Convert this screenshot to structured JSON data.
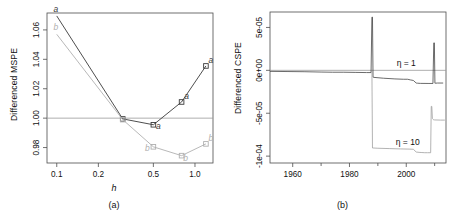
{
  "figure": {
    "corner_mark": "",
    "background": "#ffffff"
  },
  "panels": [
    {
      "id": "a",
      "caption": "(a)",
      "xlabel": "h",
      "ylabel": "Differenced MSPE"
    },
    {
      "id": "b",
      "caption": "(b)",
      "xlabel": "",
      "ylabel": "Differenced CSPE"
    }
  ],
  "colors": {
    "series_a": "#3a3a3a",
    "series_b": "#b0b0b0",
    "axis": "#4d4d4d",
    "reference_line": "#999999",
    "curve_eta1": "#3a3a3a",
    "curve_eta10": "#9a9a9a"
  },
  "chart_data": [
    {
      "type": "line",
      "panel": "a",
      "title": "",
      "xlabel": "h",
      "ylabel": "Differenced MSPE",
      "xscale": "log",
      "xlim": [
        0.085,
        1.35
      ],
      "ylim": [
        0.9695,
        1.0715
      ],
      "xticks": [
        0.1,
        0.2,
        0.5,
        1.0
      ],
      "xticklabels": [
        "0.1",
        "0.2",
        "0.5",
        "1.0"
      ],
      "yticks": [
        0.98,
        1.0,
        1.02,
        1.04,
        1.06
      ],
      "yticklabels": [
        "0.98",
        "1.00",
        "1.02",
        "1.04",
        "1.06"
      ],
      "grid": false,
      "reference_line_y": 1.0,
      "point_marker": "square",
      "series": [
        {
          "name": "a",
          "label": "a",
          "color": "#3a3a3a",
          "x": [
            0.1,
            0.3,
            0.5,
            0.8,
            1.2
          ],
          "values": [
            1.0695,
            0.9995,
            0.9955,
            1.011,
            1.0355
          ]
        },
        {
          "name": "b",
          "label": "b",
          "color": "#b0b0b0",
          "x": [
            0.1,
            0.3,
            0.5,
            0.8,
            1.2
          ],
          "values": [
            1.057,
            0.999,
            0.9805,
            0.9745,
            0.9825
          ]
        }
      ]
    },
    {
      "type": "line",
      "panel": "b",
      "title": "",
      "xlabel": "",
      "ylabel": "Differenced CSPE",
      "xlim": [
        1952,
        2014
      ],
      "ylim": [
        -0.000108,
        6.8e-05
      ],
      "xticks": [
        1960,
        1980,
        2000
      ],
      "xticklabels": [
        "1960",
        "1980",
        "2000"
      ],
      "yticks": [
        -0.0001,
        -5e-05,
        0.0,
        5e-05
      ],
      "yticklabels": [
        "-1e-04",
        "-5e-05",
        "0e+00",
        "5e-05"
      ],
      "grid": false,
      "reference_line_y": 0.0,
      "annotations": [
        {
          "text": "η = 1",
          "x": 2000,
          "y": 4.5e-06
        },
        {
          "text": "η = 10",
          "x": 2000.5,
          "y": -8.75e-05
        }
      ],
      "series": [
        {
          "name": "eta1",
          "label": "η = 1",
          "color": "#3a3a3a",
          "x": [
            1952,
            1958,
            1964,
            1970,
            1974,
            1978,
            1982,
            1986,
            1987.6,
            1987.9,
            1988.1,
            1988.3,
            1988.45,
            1988.6,
            1992,
            1996,
            1999,
            2000.5,
            2001.5,
            2002.5,
            2003.5,
            2004,
            2005,
            2008,
            2009.4,
            2009.7,
            2009.9,
            2010.1,
            2010.3,
            2011,
            2013
          ],
          "values": [
            -1.2e-06,
            -1.4e-06,
            -1.6e-06,
            -2e-06,
            -2.2e-06,
            -2.2e-06,
            -2.4e-06,
            -2.6e-06,
            -2.6e-06,
            6.2e-05,
            6.2e-05,
            -8e-06,
            -8.1e-06,
            -8.2e-06,
            -9.2e-06,
            -1e-05,
            -1.04e-05,
            -1.04e-05,
            -1.12e-05,
            -1.18e-05,
            -1.48e-05,
            -1.5e-05,
            -1.52e-05,
            -1.53e-05,
            -1.53e-05,
            3.2e-05,
            3.2e-05,
            -1.5e-05,
            -1.5e-05,
            -1.48e-05,
            -1.48e-05
          ]
        },
        {
          "name": "eta10",
          "label": "η = 10",
          "color": "#9a9a9a",
          "x": [
            1987.9,
            1988.1,
            1988.3,
            1990,
            1994,
            1998,
            2001,
            2002.5,
            2003.5,
            2004.5,
            2005.5,
            2006.5,
            2007.5,
            2008.6,
            2008.8,
            2009.0,
            2009.2,
            2009.4,
            2009.6,
            2010,
            2012,
            2013.6
          ],
          "values": [
            0.0,
            -9.05e-05,
            -9.05e-05,
            -9.08e-05,
            -9.12e-05,
            -9.16e-05,
            -9.18e-05,
            -9.2e-05,
            -9.52e-05,
            -9.56e-05,
            -9.58e-05,
            -9.6e-05,
            -9.6e-05,
            -9.6e-05,
            -4.2e-05,
            -4.2e-05,
            -5.6e-05,
            -5.7e-05,
            -5.75e-05,
            -5.78e-05,
            -5.8e-05,
            -5.8e-05
          ]
        }
      ]
    }
  ]
}
